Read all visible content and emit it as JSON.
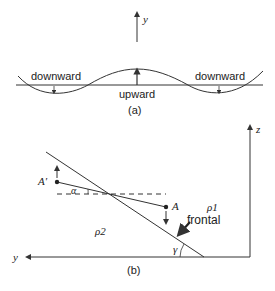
{
  "panel_a": {
    "axis_label": "y",
    "labels": {
      "left": "downward",
      "center": "upward",
      "right": "downward"
    },
    "caption": "(a)"
  },
  "panel_b": {
    "axis_z": "z",
    "axis_y": "y",
    "point_a": "A",
    "point_a_prime": "A′",
    "angle_alpha": "α",
    "angle_gamma": "γ",
    "rho1": "ρ1",
    "rho2": "ρ2",
    "frontal": "frontal",
    "caption": "(b)"
  },
  "colors": {
    "line": "#333333",
    "background": "#ffffff"
  }
}
